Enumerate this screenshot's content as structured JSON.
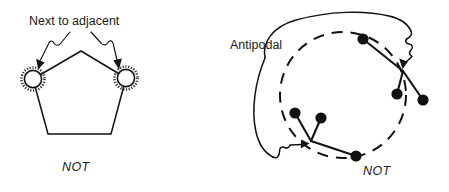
{
  "figure": {
    "background_color": "#ffffff",
    "ink_color": "#111111",
    "width": 449,
    "height": 192,
    "style": "hand-drawn line diagram"
  },
  "panels": [
    {
      "id": "left",
      "caption": "NOT",
      "annotation": "Next to adjacent",
      "shape": "pentagon",
      "marked_vertices": 2,
      "marked_vertex_style": "double-circle",
      "pointer_count": 2,
      "pointer_style": "squiggly-arrow"
    },
    {
      "id": "right",
      "caption": "NOT",
      "annotation": "Antipodal",
      "shape": "dashed-circle",
      "point_count": 6,
      "cluster_count": 2,
      "pointer_count": 2,
      "pointer_style": "squiggly-arrow"
    }
  ],
  "left_panel": {
    "label": "Next to adjacent",
    "caption": "NOT",
    "vertex_marker_name": "double-circle-marker",
    "arrow_left_name": "squiggly-arrow-left",
    "arrow_right_name": "squiggly-arrow-right"
  },
  "right_panel": {
    "label": "Antipodal",
    "caption": "NOT",
    "ring_name": "dashed-circle",
    "cluster_upper_right": 3,
    "cluster_lower_left": 3
  }
}
